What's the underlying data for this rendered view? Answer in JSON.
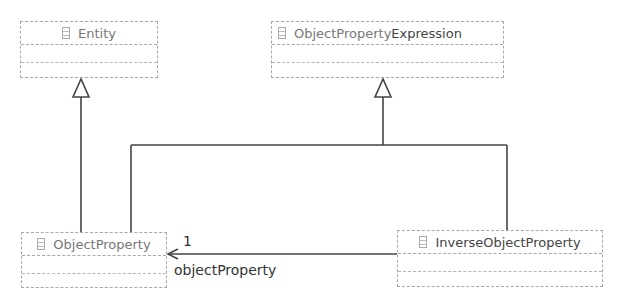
{
  "diagram": {
    "type": "UML class diagram",
    "classes": [
      {
        "id": "entity",
        "name": "Entity"
      },
      {
        "id": "ope",
        "name_part1": "ObjectProperty",
        "name_part2": "Expression"
      },
      {
        "id": "op",
        "name": "ObjectProperty"
      },
      {
        "id": "iop",
        "name": "InverseObjectProperty"
      }
    ],
    "relations": [
      {
        "type": "generalization",
        "from": "ObjectProperty",
        "to": "Entity"
      },
      {
        "type": "generalization",
        "from": "ObjectProperty",
        "to": "ObjectPropertyExpression"
      },
      {
        "type": "generalization",
        "from": "InverseObjectProperty",
        "to": "ObjectPropertyExpression"
      },
      {
        "type": "association",
        "from": "InverseObjectProperty",
        "to": "ObjectProperty",
        "multiplicity": "1",
        "role": "objectProperty"
      }
    ]
  }
}
